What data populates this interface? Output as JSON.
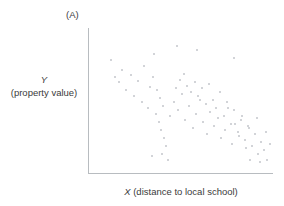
{
  "figure": {
    "panel_label": "(A)",
    "y_axis_symbol": "Y",
    "y_axis_unit": "(property value)",
    "x_axis_symbol": "X",
    "x_axis_unit": " (distance to local school)",
    "marker_color": "#d2d4d8",
    "axis_color": "#b8bcc0",
    "text_color": "#3b3b3b"
  },
  "chart_data": {
    "type": "scatter",
    "title": "(A)",
    "xlabel": "X (distance to local school)",
    "ylabel": "Y (property value)",
    "xlim": [
      0,
      184
    ],
    "ylim": [
      0,
      145
    ],
    "grid": false,
    "legend": null,
    "axis_ticks": false,
    "relationship": "negative",
    "n_points": 82,
    "series": [
      {
        "name": "properties",
        "points": [
          [
            21,
            114
          ],
          [
            32,
            104
          ],
          [
            25,
            97
          ],
          [
            29,
            92
          ],
          [
            41,
            99
          ],
          [
            48,
            93
          ],
          [
            54,
            108
          ],
          [
            60,
            87
          ],
          [
            36,
            84
          ],
          [
            44,
            78
          ],
          [
            52,
            72
          ],
          [
            58,
            66
          ],
          [
            63,
            97
          ],
          [
            67,
            84
          ],
          [
            70,
            76
          ],
          [
            73,
            68
          ],
          [
            66,
            60
          ],
          [
            69,
            52
          ],
          [
            71,
            44
          ],
          [
            74,
            36
          ],
          [
            76,
            28
          ],
          [
            72,
            20
          ],
          [
            78,
            14
          ],
          [
            80,
            58
          ],
          [
            84,
            72
          ],
          [
            88,
            64
          ],
          [
            92,
            80
          ],
          [
            95,
            54
          ],
          [
            99,
            68
          ],
          [
            103,
            46
          ],
          [
            106,
            60
          ],
          [
            110,
            74
          ],
          [
            113,
            52
          ],
          [
            117,
            40
          ],
          [
            120,
            62
          ],
          [
            124,
            48
          ],
          [
            128,
            56
          ],
          [
            131,
            36
          ],
          [
            135,
            44
          ],
          [
            138,
            66
          ],
          [
            142,
            30
          ],
          [
            145,
            50
          ],
          [
            149,
            38
          ],
          [
            152,
            58
          ],
          [
            156,
            26
          ],
          [
            159,
            46
          ],
          [
            86,
            86
          ],
          [
            90,
            94
          ],
          [
            94,
            100
          ],
          [
            97,
            88
          ],
          [
            101,
            82
          ],
          [
            105,
            92
          ],
          [
            108,
            78
          ],
          [
            112,
            86
          ],
          [
            116,
            70
          ],
          [
            119,
            90
          ],
          [
            123,
            74
          ],
          [
            126,
            66
          ],
          [
            130,
            82
          ],
          [
            134,
            58
          ],
          [
            137,
            72
          ],
          [
            141,
            50
          ],
          [
            144,
            64
          ],
          [
            148,
            42
          ],
          [
            151,
            54
          ],
          [
            155,
            34
          ],
          [
            158,
            48
          ],
          [
            162,
            28
          ],
          [
            165,
            40
          ],
          [
            168,
            20
          ],
          [
            171,
            32
          ],
          [
            174,
            24
          ],
          [
            177,
            14
          ],
          [
            180,
            30
          ],
          [
            167,
            56
          ],
          [
            170,
            12
          ],
          [
            176,
            42
          ],
          [
            64,
            120
          ],
          [
            87,
            128
          ],
          [
            107,
            124
          ],
          [
            62,
            18
          ],
          [
            144,
            116
          ],
          [
            160,
            14
          ]
        ]
      }
    ]
  }
}
